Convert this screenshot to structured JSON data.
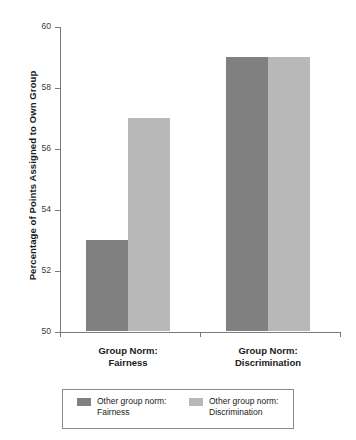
{
  "chart_data": {
    "type": "bar",
    "title": "",
    "xlabel": "",
    "ylabel": "Percentage of Points Assigned to Own Group",
    "ylim": [
      50,
      60
    ],
    "yticks": [
      50,
      52,
      54,
      56,
      58,
      60
    ],
    "ytick_labels": [
      "50",
      "52",
      "54",
      "56",
      "58",
      "60"
    ],
    "grid": false,
    "legend_position": "below-axes",
    "categories": [
      "Group Norm:\nFairness",
      "Group Norm:\nDiscrimination"
    ],
    "category_labels": [
      {
        "line1": "Group Norm:",
        "line2": "Fairness"
      },
      {
        "line1": "Group Norm:",
        "line2": "Discrimination"
      }
    ],
    "series": [
      {
        "name": "Other group norm:\nFairness",
        "legend_line1": "Other group norm:",
        "legend_line2": "Fairness",
        "color": "#808080",
        "values": [
          53,
          59
        ]
      },
      {
        "name": "Other group norm:\nDiscrimination",
        "legend_line1": "Other group norm:",
        "legend_line2": "Discrimination",
        "color": "#b8b8b8",
        "values": [
          57,
          59
        ]
      }
    ]
  },
  "colors": {
    "series_dark": "#808080",
    "series_light": "#b8b8b8",
    "axis": "#7a7a7a",
    "text": "#1a1a1a",
    "background": "#ffffff"
  }
}
